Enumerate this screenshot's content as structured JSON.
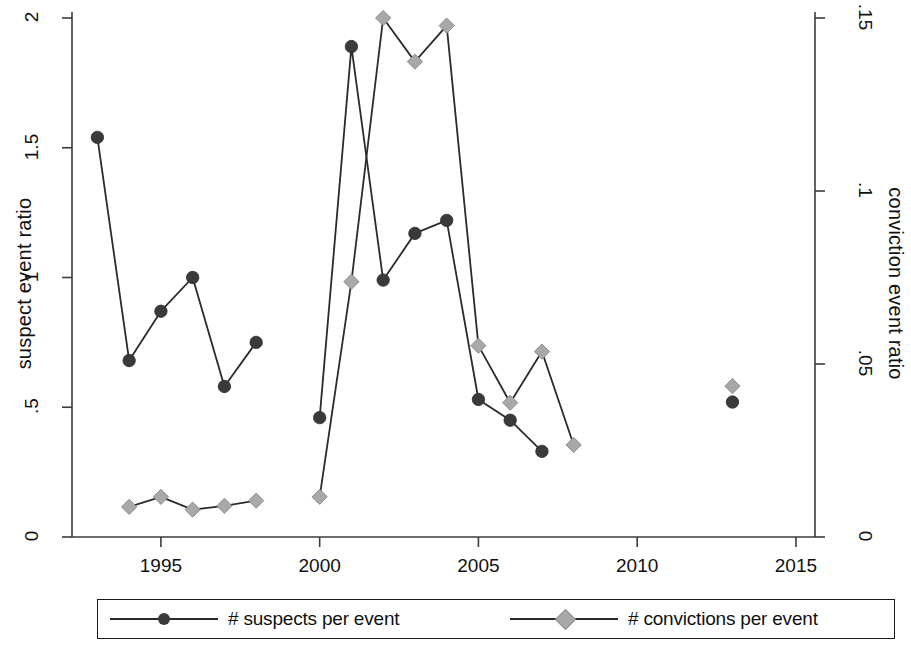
{
  "chart_data": {
    "type": "line",
    "title": "",
    "xlabel": "",
    "ylabel": "suspect event ratio",
    "y2label": "conviction event ratio",
    "xlim": [
      1992.2,
      2015.6
    ],
    "ylim": [
      0,
      2
    ],
    "y2lim": [
      0,
      0.15
    ],
    "grid": false,
    "legend_position": "bottom",
    "xticks": [
      "1995",
      "2000",
      "2005",
      "2010",
      "2015"
    ],
    "xtick_values": [
      1995,
      2000,
      2005,
      2010,
      2015
    ],
    "yticks_left": [
      "0",
      ".5",
      "1",
      "1.5",
      "2"
    ],
    "ytick_values_left": [
      0,
      0.5,
      1,
      1.5,
      2
    ],
    "yticks_right": [
      "0",
      ".05",
      ".1",
      ".15"
    ],
    "ytick_values_right": [
      0,
      0.05,
      0.1,
      0.15
    ],
    "series": [
      {
        "name": "# suspects per event",
        "axis": "left",
        "marker": "circle",
        "color": "#3a3a3a",
        "line_color": "#2b2b2b",
        "segments": [
          {
            "x": [
              1993,
              1994,
              1995,
              1996,
              1997,
              1998
            ],
            "y": [
              1.54,
              0.68,
              0.87,
              1.0,
              0.58,
              0.75
            ]
          },
          {
            "x": [
              2000,
              2001,
              2002,
              2003,
              2004,
              2005,
              2006,
              2007
            ],
            "y": [
              0.46,
              1.89,
              0.99,
              1.17,
              1.22,
              0.53,
              0.45,
              0.33
            ]
          },
          {
            "x": [
              2013
            ],
            "y": [
              0.52
            ]
          }
        ]
      },
      {
        "name": "# convictions per event",
        "axis": "right",
        "marker": "diamond",
        "color": "#a8a8a8",
        "line_color": "#2b2b2b",
        "segments": [
          {
            "x": [
              1994,
              1995,
              1996,
              1997,
              1998
            ],
            "y": [
              0.0087,
              0.0116,
              0.0079,
              0.009,
              0.0105
            ]
          },
          {
            "x": [
              2000,
              2001,
              2002,
              2003,
              2004,
              2005,
              2006,
              2007,
              2008
            ],
            "y": [
              0.0116,
              0.0738,
              0.15,
              0.1374,
              0.1478,
              0.0553,
              0.0388,
              0.0536,
              0.0266
            ]
          },
          {
            "x": [
              2013
            ],
            "y": [
              0.0436
            ]
          }
        ]
      }
    ]
  },
  "axes": {
    "left_title": "suspect event ratio",
    "right_title": "conviction event ratio",
    "x_ticks": [
      "1995",
      "2000",
      "2005",
      "2010",
      "2015"
    ],
    "y_ticks_left": [
      "0",
      ".5",
      "1",
      "1.5",
      "2"
    ],
    "y_ticks_right": [
      "0",
      ".05",
      ".1",
      ".15"
    ]
  },
  "legend": {
    "entries": [
      {
        "label": "# suspects per event",
        "marker": "circle-marker"
      },
      {
        "label": "# convictions per event",
        "marker": "diamond-marker"
      }
    ]
  },
  "colors": {
    "suspects_marker": "#3a3a3a",
    "convictions_marker": "#a8a8a8",
    "line": "#2b2b2b",
    "axis": "#3c3c3c",
    "background": "#ffffff"
  }
}
